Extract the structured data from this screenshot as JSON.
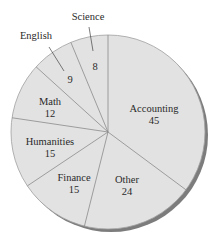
{
  "chart_data": {
    "type": "pie",
    "title": "",
    "start_angle_deg": 0,
    "direction": "clockwise",
    "categories": [
      "Accounting",
      "Other",
      "Finance",
      "Humanities",
      "Math",
      "English",
      "Science"
    ],
    "values": [
      45,
      24,
      15,
      15,
      12,
      9,
      8
    ],
    "total": 128,
    "slices": [
      {
        "label": "Accounting",
        "value": 45
      },
      {
        "label": "Other",
        "value": 24
      },
      {
        "label": "Finance",
        "value": 15
      },
      {
        "label": "Humanities",
        "value": 15
      },
      {
        "label": "Math",
        "value": 12
      },
      {
        "label": "English",
        "value": 9
      },
      {
        "label": "Science",
        "value": 8
      }
    ],
    "legend": "none",
    "labels_inside": [
      "Accounting",
      "Other",
      "Finance",
      "Humanities",
      "Math"
    ],
    "labels_outside_with_leader": [
      "English",
      "Science"
    ]
  },
  "style": {
    "fill": "#e2e2e2",
    "divider": "#8a8a8a",
    "outline": "#9a9a9a",
    "shadow": "#7c7c7c",
    "text": "#2a2a2a"
  },
  "labels": {
    "accounting": {
      "name": "Accounting",
      "value": "45"
    },
    "other": {
      "name": "Other",
      "value": "24"
    },
    "finance": {
      "name": "Finance",
      "value": "15"
    },
    "humanities": {
      "name": "Humanities",
      "value": "15"
    },
    "math": {
      "name": "Math",
      "value": "12"
    },
    "english": {
      "name": "English",
      "value": "9"
    },
    "science": {
      "name": "Science",
      "value": "8"
    }
  }
}
